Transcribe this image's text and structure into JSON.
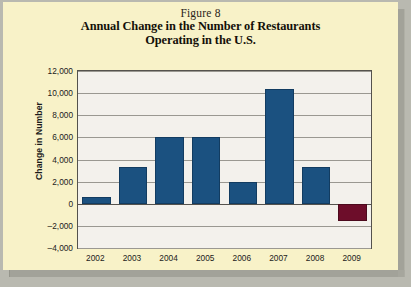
{
  "page": {
    "background_color": "#f8f2c8"
  },
  "figure": {
    "figure_label": "Figure 8",
    "title_line1": "Annual Change in the Number of Restaurants",
    "title_line2": "Operating in the U.S."
  },
  "chart_data": {
    "type": "bar",
    "title": "Annual Change in the Number of Restaurants Operating in the U.S.",
    "xlabel": "",
    "ylabel": "Change in Number",
    "categories": [
      "2002",
      "2003",
      "2004",
      "2005",
      "2006",
      "2007",
      "2008",
      "2009"
    ],
    "values": [
      600,
      3300,
      6000,
      6000,
      2000,
      10400,
      3300,
      -1600
    ],
    "ylim": [
      -4000,
      12000
    ],
    "yticks": [
      "12,000",
      "10,000",
      "8,000",
      "6,000",
      "4,000",
      "2,000",
      "0",
      "–2,000",
      "–4,000"
    ],
    "ytick_values": [
      12000,
      10000,
      8000,
      6000,
      4000,
      2000,
      0,
      -2000,
      -4000
    ],
    "grid": true,
    "legend": false,
    "bar_colors": [
      "#1b5180",
      "#1b5180",
      "#1b5180",
      "#1b5180",
      "#1b5180",
      "#1b5180",
      "#1b5180",
      "#6d0d2a"
    ],
    "positive_color": "#1b5180",
    "negative_color": "#6d0d2a",
    "plot_background": "#f3f1ec",
    "gridline_color": "#9a9891"
  }
}
